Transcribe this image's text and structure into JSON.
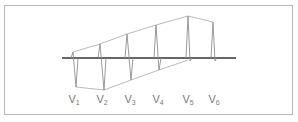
{
  "diagram": {
    "title": "",
    "colors": {
      "frame": "#b8b8b8",
      "baseline": "#222222",
      "trace": "#9a9a9a",
      "label": "#7a7a7a"
    },
    "leads": [
      {
        "name": "V",
        "sub": "1",
        "x": 74
      },
      {
        "name": "V",
        "sub": "2",
        "x": 102
      },
      {
        "name": "V",
        "sub": "3",
        "x": 130
      },
      {
        "name": "V",
        "sub": "4",
        "x": 158
      },
      {
        "name": "V",
        "sub": "5",
        "x": 188
      },
      {
        "name": "V",
        "sub": "6",
        "x": 214
      }
    ]
  }
}
